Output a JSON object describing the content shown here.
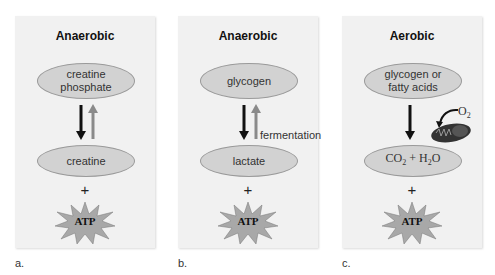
{
  "panels": [
    {
      "letter": "a.",
      "title": "Anaerobic",
      "top_molecule": [
        "creatine",
        "phosphate"
      ],
      "bottom_molecule": "creatine",
      "arrows": "reversible",
      "plus": "+",
      "product": "ATP"
    },
    {
      "letter": "b.",
      "title": "Anaerobic",
      "top_molecule": [
        "glycogen"
      ],
      "bottom_molecule": "lactate",
      "arrows": "reversible",
      "arrow_label": "fermentation",
      "plus": "+",
      "product": "ATP"
    },
    {
      "letter": "c.",
      "title": "Aerobic",
      "top_molecule": [
        "glycogen or",
        "fatty acids"
      ],
      "bottom_molecule": {
        "co2": "CO",
        "co2_sub": "2",
        "plus": " + H",
        "h2o_sub": "2",
        "o": "O"
      },
      "arrows": "forward",
      "oxygen_label": "O",
      "oxygen_sub": "2",
      "organelle_icon": "mitochondrion-icon",
      "plus": "+",
      "product": "ATP"
    }
  ],
  "colors": {
    "panel_bg": "#f1f1f1",
    "ellipse_fill": "#d2d2d2",
    "forward_arrow": "#111111",
    "reverse_arrow": "#8a8a8a",
    "atp_star": "#a8a8a8",
    "mitochondrion": "#333333"
  }
}
